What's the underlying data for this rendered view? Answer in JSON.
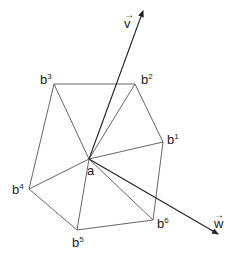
{
  "diagram": {
    "center": {
      "name": "a",
      "x": 89,
      "y": 159,
      "label": "a"
    },
    "vertices": [
      {
        "id": "b1",
        "base": "b",
        "sup": "1",
        "x": 163,
        "y": 142,
        "lx": 167,
        "ly": 133
      },
      {
        "id": "b2",
        "base": "b",
        "sup": "2",
        "x": 135,
        "y": 84,
        "lx": 141,
        "ly": 73
      },
      {
        "id": "b3",
        "base": "b",
        "sup": "3",
        "x": 54,
        "y": 84,
        "lx": 40,
        "ly": 73
      },
      {
        "id": "b4",
        "base": "b",
        "sup": "4",
        "x": 29,
        "y": 189,
        "lx": 12,
        "ly": 183
      },
      {
        "id": "b5",
        "base": "b",
        "sup": "5",
        "x": 77,
        "y": 230,
        "lx": 72,
        "ly": 236
      },
      {
        "id": "b6",
        "base": "b",
        "sup": "6",
        "x": 153,
        "y": 220,
        "lx": 157,
        "ly": 217
      }
    ],
    "vectors": [
      {
        "id": "v",
        "label": "v",
        "arrow": "→",
        "x2": 143,
        "y2": 11,
        "lx": 124,
        "ly": 17
      },
      {
        "id": "w",
        "label": "w",
        "arrow": "→",
        "x2": 218,
        "y2": 234,
        "lx": 214,
        "ly": 217
      }
    ],
    "colors": {
      "line": "#555555",
      "vector": "#222222",
      "text": "#222222"
    }
  }
}
